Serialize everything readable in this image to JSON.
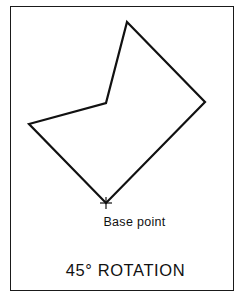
{
  "figure": {
    "base_point_label": "Base point",
    "title": "45° ROTATION",
    "colors": {
      "line": "#111111",
      "background": "#ffffff",
      "frame": "#1a1a1a"
    },
    "polygon": {
      "vertices": [
        {
          "name": "top",
          "x": 127,
          "y": 22
        },
        {
          "name": "right",
          "x": 205,
          "y": 102
        },
        {
          "name": "base",
          "x": 106,
          "y": 203
        },
        {
          "name": "left",
          "x": 29,
          "y": 124
        },
        {
          "name": "inner",
          "x": 106,
          "y": 103
        }
      ]
    },
    "base_point_marker": {
      "x": 106,
      "y": 203,
      "symbol": "plus"
    }
  }
}
